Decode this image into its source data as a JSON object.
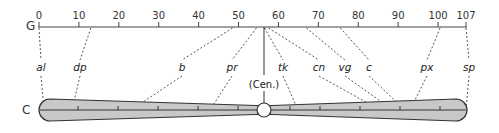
{
  "diagram": {
    "genetic_map": {
      "axis_letter": "G",
      "scale_min": 0,
      "scale_max": 107,
      "ticks": [
        {
          "label": "0",
          "value": 0
        },
        {
          "label": "10",
          "value": 10
        },
        {
          "label": "20",
          "value": 20
        },
        {
          "label": "30",
          "value": 30
        },
        {
          "label": "40",
          "value": 40
        },
        {
          "label": "50",
          "value": 50
        },
        {
          "label": "60",
          "value": 60
        },
        {
          "label": "70",
          "value": 70
        },
        {
          "label": "80",
          "value": 80
        },
        {
          "label": "90",
          "value": 90
        },
        {
          "label": "100",
          "value": 100
        },
        {
          "label": "107",
          "value": 107
        }
      ]
    },
    "cytological_map": {
      "axis_letter": "C",
      "centromere_label": "(Cen.)",
      "fill_color": "#c8c8c8",
      "outline_color": "#333333"
    },
    "genes": [
      {
        "symbol": "al",
        "genetic_position": 0,
        "chromosome_x": 44
      },
      {
        "symbol": "dp",
        "genetic_position": 13,
        "chromosome_x": 72
      },
      {
        "symbol": "b",
        "genetic_position": 48.5,
        "chromosome_x": 131
      },
      {
        "symbol": "pr",
        "genetic_position": 54.5,
        "chromosome_x": 210
      },
      {
        "symbol": "tk",
        "genetic_position": 56.5,
        "chromosome_x": 298
      },
      {
        "symbol": "cn",
        "genetic_position": 57.5,
        "chromosome_x": 380
      },
      {
        "symbol": "vg",
        "genetic_position": 67,
        "chromosome_x": 393
      },
      {
        "symbol": "c",
        "genetic_position": 75.5,
        "chromosome_x": 405
      },
      {
        "symbol": "px",
        "genetic_position": 100.5,
        "chromosome_x": 410
      },
      {
        "symbol": "sp",
        "genetic_position": 107,
        "chromosome_x": 466
      }
    ]
  }
}
